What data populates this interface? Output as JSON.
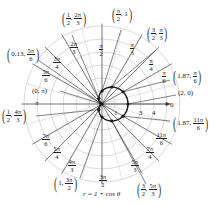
{
  "figure": {
    "equation": "r = 1 + cos θ",
    "curve": "cardioid",
    "origin": {
      "x": 102,
      "y": 104
    },
    "unit_px": 13,
    "grid_radii": [
      1,
      2,
      3,
      4,
      5,
      6
    ],
    "radial_axis_labels": [
      "1",
      "3",
      "4"
    ],
    "polar_axis_label": "0",
    "colors": {
      "grid": "#c8c8c8",
      "curve": "#1a1a1a",
      "lines": "#333333",
      "text": "#222222"
    }
  },
  "angle_labels": [
    {
      "id": "pi_over_2",
      "num": "π",
      "den": "2"
    },
    {
      "id": "pi_over_3",
      "num": "π",
      "den": "3"
    },
    {
      "id": "pi_over_4",
      "num": "π",
      "den": "4"
    },
    {
      "id": "pi_over_6",
      "num": "π",
      "den": "6"
    },
    {
      "id": "two_pi_over_3",
      "num": "2π",
      "den": "3"
    },
    {
      "id": "three_pi_over_4",
      "num": "3π",
      "den": "4"
    },
    {
      "id": "five_pi_over_6",
      "num": "5π",
      "den": "6"
    },
    {
      "id": "pi",
      "text": "π"
    },
    {
      "id": "seven_pi_over_6",
      "num": "7π",
      "den": "6"
    },
    {
      "id": "five_pi_over_4",
      "num": "5π",
      "den": "4"
    },
    {
      "id": "four_pi_over_3",
      "num": "4π",
      "den": "3"
    },
    {
      "id": "three_pi_over_2",
      "num": "3π",
      "den": "2"
    },
    {
      "id": "five_pi_over_3",
      "num": "5π",
      "den": "3"
    },
    {
      "id": "seven_pi_over_4",
      "num": "7π",
      "den": "4"
    },
    {
      "id": "eleven_pi_over_6",
      "num": "11π",
      "den": "6"
    }
  ],
  "points": [
    {
      "r": "π",
      "r_den": "2",
      "theta_text": "1",
      "label": "(π/2, 1)",
      "first": "π/2",
      "second": "1"
    },
    {
      "label": "(1/2, 2π/3)",
      "r_num": "1",
      "r_den": "2",
      "t_num": "2π",
      "t_den": "3"
    },
    {
      "label": "(3/2, π/3)",
      "r_num": "3",
      "r_den": "2",
      "t_num": "π",
      "t_den": "3"
    },
    {
      "label": "(0.13, 5π/6)",
      "r_text": "0.13",
      "t_num": "5π",
      "t_den": "6"
    },
    {
      "label": "(1.87, π/6)",
      "r_text": "1.87",
      "t_num": "π",
      "t_den": "6"
    },
    {
      "label": "(0, π)",
      "text": "(0, π)"
    },
    {
      "label": "(2, 0)",
      "text": "(2, 0)"
    },
    {
      "label": "(1/2, 4π/3)",
      "r_num": "1",
      "r_den": "2",
      "t_num": "4π",
      "t_den": "3"
    },
    {
      "label": "(1.87, 11π/6)",
      "r_text": "1.87",
      "t_num": "11π",
      "t_den": "6"
    },
    {
      "label": "(1, 3π/2)",
      "r_text": "1",
      "t_num": "3π",
      "t_den": "2"
    },
    {
      "label": "(3/2, 5π/3)",
      "r_num": "3",
      "r_den": "2",
      "t_num": "5π",
      "t_den": "3"
    }
  ],
  "chart_data": {
    "type": "polar",
    "title": "r = 1 + cos θ",
    "series": [
      {
        "name": "r = 1 + cos θ",
        "points": [
          {
            "r": 2,
            "theta": "0"
          },
          {
            "r": 1.87,
            "theta": "π/6"
          },
          {
            "r": 1.5,
            "theta": "π/3"
          },
          {
            "r": 1,
            "theta": "π/2"
          },
          {
            "r": 0.5,
            "theta": "2π/3"
          },
          {
            "r": 0.13,
            "theta": "5π/6"
          },
          {
            "r": 0,
            "theta": "π"
          },
          {
            "r": 0.5,
            "theta": "4π/3"
          },
          {
            "r": 1,
            "theta": "3π/2"
          },
          {
            "r": 1.5,
            "theta": "5π/3"
          },
          {
            "r": 1.87,
            "theta": "11π/6"
          }
        ]
      }
    ],
    "angle_ticks": [
      "0",
      "π/6",
      "π/4",
      "π/3",
      "π/2",
      "2π/3",
      "3π/4",
      "5π/6",
      "π",
      "7π/6",
      "5π/4",
      "4π/3",
      "3π/2",
      "5π/3",
      "7π/4",
      "11π/6"
    ],
    "radial_ticks": [
      "1",
      "3",
      "4"
    ],
    "grid": true
  }
}
